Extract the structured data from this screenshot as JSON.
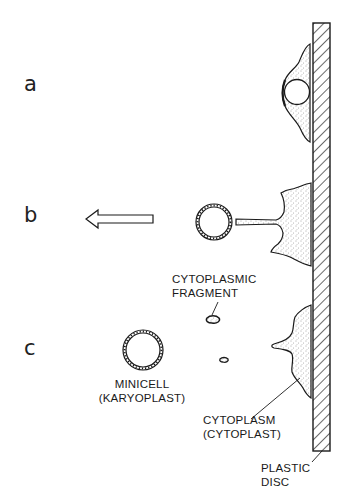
{
  "panels": [
    {
      "id": "a",
      "label": "a"
    },
    {
      "id": "b",
      "label": "b"
    },
    {
      "id": "c",
      "label": "c"
    }
  ],
  "labels": {
    "cytoplasmic_fragment": [
      "CYTOPLASMIC",
      "FRAGMENT"
    ],
    "minicell": [
      "MINICELL",
      "(KARYOPLAST)"
    ],
    "cytoplasm": [
      "CYTOPLASM",
      "(CYTOPLAST)"
    ],
    "plastic_disc": [
      "PLASTIC",
      "DISC"
    ]
  },
  "arrow": {
    "direction": "left",
    "meaning": "centrifugal-force-direction"
  },
  "colors": {
    "ink": "#1a1a1a",
    "background": "#ffffff"
  }
}
